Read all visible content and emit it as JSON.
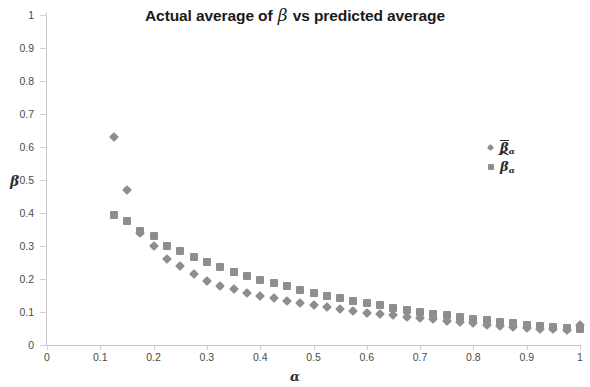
{
  "chart_data": {
    "type": "scatter",
    "title": "Actual average of β vs predicted average",
    "title_prefix": "Actual average of",
    "title_beta": "β",
    "title_suffix": "vs predicted average",
    "xlabel": "α",
    "ylabel": "β",
    "xlim": [
      0,
      1
    ],
    "ylim": [
      0,
      1
    ],
    "grid": false,
    "legend_position": "upper-right-inside",
    "marker_color": "#8e8e8e",
    "axis_color": "#c8c8c8",
    "tick_label_color": "#4a4a4a",
    "xticks": [
      "0",
      "0.1",
      "0.2",
      "0.3",
      "0.4",
      "0.5",
      "0.6",
      "0.7",
      "0.8",
      "0.9",
      "1"
    ],
    "xtick_values": [
      0,
      0.1,
      0.2,
      0.3,
      0.4,
      0.5,
      0.6,
      0.7,
      0.8,
      0.9,
      1
    ],
    "yticks": [
      "0",
      "0.1",
      "0.2",
      "0.3",
      "0.4",
      "0.5",
      "0.6",
      "0.7",
      "0.8",
      "0.9",
      "1"
    ],
    "ytick_values": [
      0,
      0.1,
      0.2,
      0.3,
      0.4,
      0.5,
      0.6,
      0.7,
      0.8,
      0.9,
      1
    ],
    "legend": [
      {
        "marker": "diamond",
        "base": "β",
        "accent": "overline",
        "subscript": "α"
      },
      {
        "marker": "square",
        "base": "β",
        "accent": "hat",
        "subscript": "α"
      }
    ],
    "series": [
      {
        "name": "β̄α",
        "marker": "diamond",
        "color": "#8e8e8e",
        "x": [
          0.125,
          0.15,
          0.175,
          0.2,
          0.225,
          0.25,
          0.275,
          0.3,
          0.325,
          0.35,
          0.375,
          0.4,
          0.425,
          0.45,
          0.475,
          0.5,
          0.525,
          0.55,
          0.575,
          0.6,
          0.625,
          0.65,
          0.675,
          0.7,
          0.725,
          0.75,
          0.775,
          0.8,
          0.825,
          0.85,
          0.875,
          0.9,
          0.925,
          0.95,
          0.975,
          1.0
        ],
        "y": [
          0.63,
          0.47,
          0.34,
          0.3,
          0.26,
          0.24,
          0.215,
          0.195,
          0.18,
          0.17,
          0.158,
          0.15,
          0.142,
          0.133,
          0.126,
          0.12,
          0.114,
          0.108,
          0.103,
          0.098,
          0.094,
          0.09,
          0.086,
          0.082,
          0.078,
          0.074,
          0.07,
          0.066,
          0.062,
          0.059,
          0.056,
          0.053,
          0.05,
          0.048,
          0.046,
          0.062
        ]
      },
      {
        "name": "β̂α",
        "marker": "square",
        "color": "#8e8e8e",
        "x": [
          0.125,
          0.15,
          0.175,
          0.2,
          0.225,
          0.25,
          0.275,
          0.3,
          0.325,
          0.35,
          0.375,
          0.4,
          0.425,
          0.45,
          0.475,
          0.5,
          0.525,
          0.55,
          0.575,
          0.6,
          0.625,
          0.65,
          0.675,
          0.7,
          0.725,
          0.75,
          0.775,
          0.8,
          0.825,
          0.85,
          0.875,
          0.9,
          0.925,
          0.95,
          0.975,
          1.0
        ],
        "y": [
          0.393,
          0.375,
          0.345,
          0.33,
          0.3,
          0.285,
          0.268,
          0.252,
          0.235,
          0.222,
          0.21,
          0.198,
          0.188,
          0.178,
          0.168,
          0.158,
          0.15,
          0.142,
          0.134,
          0.127,
          0.12,
          0.113,
          0.107,
          0.101,
          0.095,
          0.09,
          0.085,
          0.08,
          0.075,
          0.07,
          0.066,
          0.062,
          0.058,
          0.055,
          0.052,
          0.05
        ]
      }
    ]
  }
}
